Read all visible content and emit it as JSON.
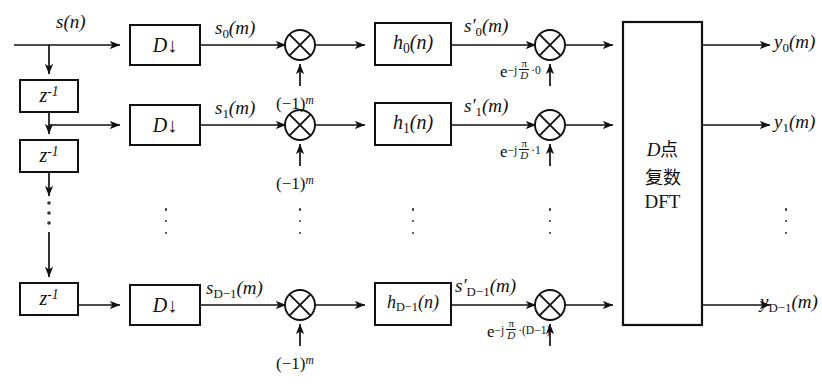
{
  "diagram": {
    "input_label": "s(n)",
    "delay_label": "z",
    "delay_exponent": "-1",
    "decimator_label": "D",
    "decimator_arrow": "↓",
    "modulator_label": "(−1)",
    "modulator_exponent": "m",
    "multiplier_glyph": "⊗",
    "dft": {
      "line1_var": "D",
      "line1_cn": "点",
      "line2_cn": "复数",
      "line3": "DFT"
    },
    "ellipsis_glyph": "⋮",
    "colors": {
      "line": "#111111",
      "background": "#ffffff",
      "text": "#111111"
    },
    "rows": [
      {
        "index": 0,
        "decimated_signal": "s",
        "decimated_sub": "0",
        "decimated_arg": "(m)",
        "filter_name": "h",
        "filter_sub": "0",
        "filter_arg": "(n)",
        "filtered_signal": "s′",
        "filtered_sub": "0",
        "filtered_arg": "(m)",
        "twiddle_base": "e",
        "twiddle_sign": "−j",
        "twiddle_num": "π",
        "twiddle_den": "D",
        "twiddle_index": "·0",
        "output": "y",
        "output_sub": "0",
        "output_arg": "(m)",
        "modulator": "(−1)",
        "modulator_exp": "m"
      },
      {
        "index": 1,
        "decimated_signal": "s",
        "decimated_sub": "1",
        "decimated_arg": "(m)",
        "filter_name": "h",
        "filter_sub": "1",
        "filter_arg": "(n)",
        "filtered_signal": "s′",
        "filtered_sub": "1",
        "filtered_arg": "(m)",
        "twiddle_base": "e",
        "twiddle_sign": "−j",
        "twiddle_num": "π",
        "twiddle_den": "D",
        "twiddle_index": "·1",
        "output": "y",
        "output_sub": "1",
        "output_arg": "(m)",
        "modulator": "(−1)",
        "modulator_exp": "m"
      },
      {
        "index": 2,
        "decimated_signal": "s",
        "decimated_sub": "D−1",
        "decimated_arg": "(m)",
        "filter_name": "h",
        "filter_sub": "D−1",
        "filter_arg": "(n)",
        "filtered_signal": "s′",
        "filtered_sub": "D−1",
        "filtered_arg": "(m)",
        "twiddle_base": "e",
        "twiddle_sign": "−j",
        "twiddle_num": "π",
        "twiddle_den": "D",
        "twiddle_index": "·(D−1)",
        "output": "y",
        "output_sub": "D−1",
        "output_arg": "(m)",
        "modulator": "(−1)",
        "modulator_exp": "m"
      }
    ]
  }
}
